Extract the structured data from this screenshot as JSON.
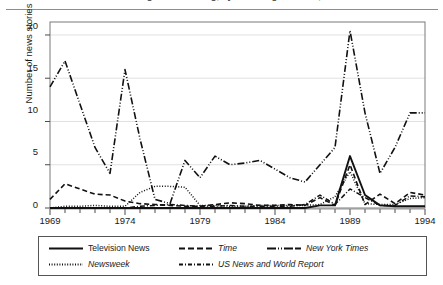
{
  "figure": {
    "caption": "Number of news stories about global warming, by news organization, 1969-1994",
    "caption_visible": false
  },
  "chart_data": {
    "type": "line",
    "title": "",
    "xlabel": "",
    "ylabel": "Number of news stories",
    "xlim": [
      1969,
      1994
    ],
    "ylim": [
      0,
      21.5
    ],
    "grid": true,
    "legend_position": "below",
    "xticks_major": [
      "1969",
      "1974",
      "1979",
      "1984",
      "1989",
      "1994"
    ],
    "xticks_major_values": [
      1969,
      1974,
      1979,
      1984,
      1989,
      1994
    ],
    "yticks": [
      "0",
      "5",
      "10",
      "15",
      "20"
    ],
    "ytick_values": [
      0,
      5,
      10,
      15,
      20
    ],
    "x": [
      1969,
      1970,
      1971,
      1972,
      1973,
      1974,
      1975,
      1976,
      1977,
      1978,
      1979,
      1980,
      1981,
      1982,
      1983,
      1984,
      1985,
      1986,
      1987,
      1988,
      1989,
      1990,
      1991,
      1992,
      1993,
      1994
    ],
    "series": [
      {
        "name": "Television News",
        "style": "solid",
        "values": [
          0,
          0,
          0,
          0,
          0,
          0,
          0,
          0,
          0,
          0,
          0,
          0,
          0,
          0,
          0,
          0,
          0,
          0,
          0.3,
          0.3,
          6,
          1.5,
          0.3,
          0.2,
          0.2,
          0.2
        ]
      },
      {
        "name": "Time",
        "style": "dashed",
        "values": [
          1,
          2.8,
          2.2,
          1.6,
          1.5,
          0.8,
          0.5,
          0.4,
          0.3,
          0.2,
          0.2,
          0.4,
          0.6,
          0.5,
          0.3,
          0.3,
          0.4,
          0.3,
          1.2,
          0.3,
          5,
          0.4,
          1.6,
          0.5,
          1.8,
          1.5
        ]
      },
      {
        "name": "New York Times",
        "style": "dashdotdot",
        "values": [
          14,
          17,
          12,
          7,
          4,
          16,
          8,
          1,
          0.5,
          5.5,
          3.5,
          6,
          5,
          5.2,
          5.5,
          4.5,
          3.5,
          3,
          5,
          7,
          20.5,
          11,
          4,
          7,
          11,
          11
        ]
      },
      {
        "name": "Newsweek",
        "style": "dotted",
        "values": [
          0,
          0.2,
          0.2,
          0.3,
          0.2,
          0.2,
          1.8,
          2.5,
          2.5,
          2.4,
          0.3,
          0.3,
          0.2,
          0.2,
          0.3,
          0.3,
          0.3,
          0.3,
          0.4,
          1.3,
          4.2,
          0.5,
          0.4,
          0.4,
          1.1,
          1.2
        ]
      },
      {
        "name": "US News and World Report",
        "style": "dashdot",
        "values": [
          0,
          0,
          0,
          0,
          0,
          0,
          0.2,
          0.3,
          0.4,
          0.3,
          0.2,
          0.2,
          0.3,
          0.2,
          0.2,
          0.2,
          0.2,
          0.4,
          1.5,
          0.4,
          2.2,
          1.2,
          0.3,
          0.3,
          1.4,
          1.3
        ]
      }
    ],
    "legend": [
      {
        "label": "Television News",
        "style": "solid"
      },
      {
        "label": "Time",
        "style": "dashed"
      },
      {
        "label": "New York Times",
        "style": "dashdotdot"
      },
      {
        "label": "Newsweek",
        "style": "dotted"
      },
      {
        "label": "US News and World Report",
        "style": "dashdot"
      }
    ]
  }
}
